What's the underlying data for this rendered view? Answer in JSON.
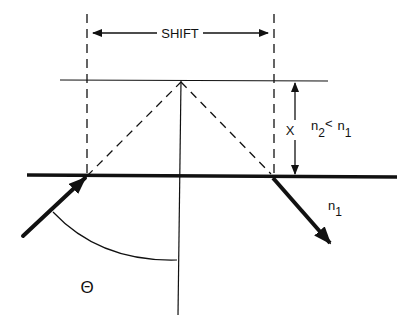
{
  "diagram": {
    "labels": {
      "shift": "SHIFT",
      "x": "X",
      "n_relation_n": "n",
      "n_relation_sub2": "2",
      "n_relation_lt": "<",
      "n_relation_n1": "n",
      "n_relation_sub1": "1",
      "n1_n": "n",
      "n1_sub": "1",
      "theta": "Θ"
    },
    "colors": {
      "stroke": "#111111",
      "background": "#ffffff"
    }
  }
}
